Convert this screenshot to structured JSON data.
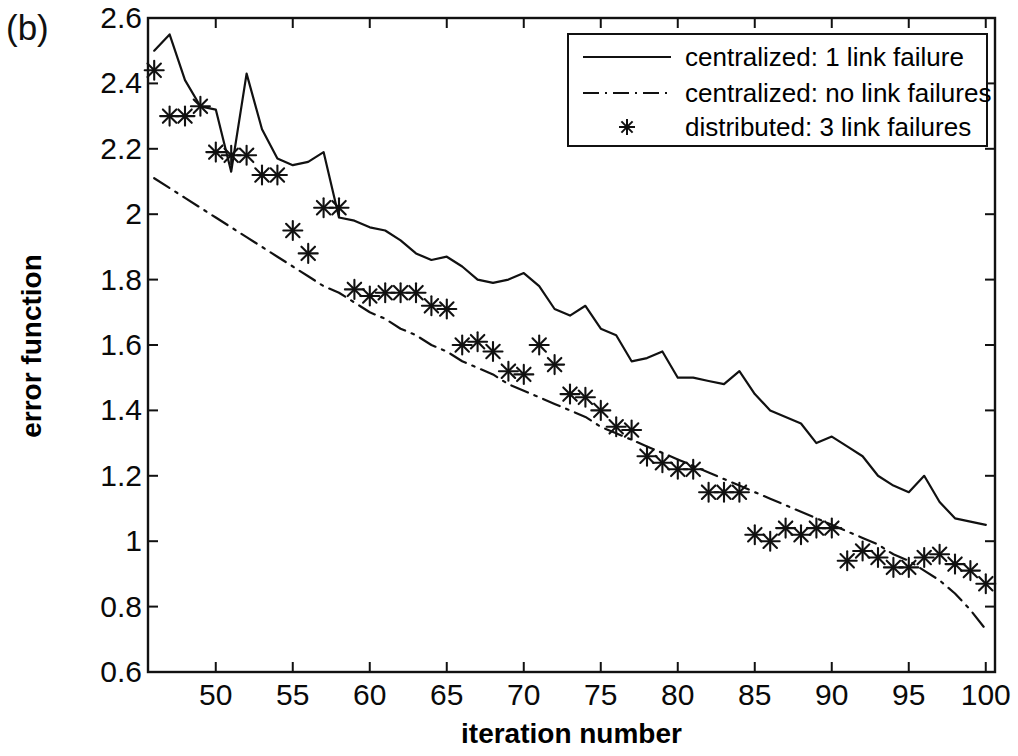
{
  "figure": {
    "panel_label": "(b)"
  },
  "chart_data": {
    "type": "line",
    "title": "",
    "xlabel": "iteration number",
    "ylabel": "error function",
    "xlim": [
      45.6,
      100.6
    ],
    "ylim": [
      0.6,
      2.6
    ],
    "xticks": [
      50,
      55,
      60,
      65,
      70,
      75,
      80,
      85,
      90,
      95,
      100
    ],
    "yticks": [
      "0.6",
      "0.8",
      "1",
      "1.2",
      "1.4",
      "1.6",
      "1.8",
      "2",
      "2.2",
      "2.4",
      "2.6"
    ],
    "grid": false,
    "legend_position": "top-right",
    "x": [
      46,
      47,
      48,
      49,
      50,
      51,
      52,
      53,
      54,
      55,
      56,
      57,
      58,
      59,
      60,
      61,
      62,
      63,
      64,
      65,
      66,
      67,
      68,
      69,
      70,
      71,
      72,
      73,
      74,
      75,
      76,
      77,
      78,
      79,
      80,
      81,
      82,
      83,
      84,
      85,
      86,
      87,
      88,
      89,
      90,
      91,
      92,
      93,
      94,
      95,
      96,
      97,
      98,
      99,
      100
    ],
    "series": [
      {
        "name": "centralized: 1 link failure",
        "style": "solid",
        "marker": "none",
        "color": "#111111",
        "values": [
          2.5,
          2.55,
          2.41,
          2.33,
          2.32,
          2.13,
          2.43,
          2.26,
          2.17,
          2.15,
          2.16,
          2.19,
          1.99,
          1.98,
          1.96,
          1.95,
          1.92,
          1.88,
          1.86,
          1.87,
          1.84,
          1.8,
          1.79,
          1.8,
          1.82,
          1.78,
          1.71,
          1.69,
          1.72,
          1.65,
          1.63,
          1.55,
          1.56,
          1.58,
          1.5,
          1.5,
          1.49,
          1.48,
          1.52,
          1.45,
          1.4,
          1.38,
          1.36,
          1.3,
          1.32,
          1.29,
          1.26,
          1.2,
          1.17,
          1.15,
          1.2,
          1.12,
          1.07,
          1.06,
          1.05
        ]
      },
      {
        "name": "centralized: no link failures",
        "style": "dashdot",
        "marker": "none",
        "color": "#111111",
        "values": [
          2.11,
          2.08,
          2.05,
          2.02,
          1.99,
          1.96,
          1.93,
          1.9,
          1.87,
          1.84,
          1.81,
          1.78,
          1.76,
          1.73,
          1.7,
          1.68,
          1.65,
          1.63,
          1.6,
          1.58,
          1.55,
          1.53,
          1.51,
          1.48,
          1.46,
          1.44,
          1.42,
          1.4,
          1.38,
          1.35,
          1.33,
          1.31,
          1.29,
          1.27,
          1.25,
          1.23,
          1.21,
          1.19,
          1.17,
          1.15,
          1.13,
          1.11,
          1.09,
          1.07,
          1.05,
          1.03,
          1.01,
          0.99,
          0.96,
          0.94,
          0.91,
          0.88,
          0.84,
          0.79,
          0.73
        ]
      },
      {
        "name": "distributed: 3 link failures",
        "style": "none",
        "marker": "asterisk",
        "color": "#111111",
        "values": [
          2.44,
          2.3,
          2.3,
          2.33,
          2.19,
          2.18,
          2.18,
          2.12,
          2.12,
          1.95,
          1.88,
          2.02,
          2.02,
          1.77,
          1.75,
          1.76,
          1.76,
          1.76,
          1.72,
          1.71,
          1.6,
          1.61,
          1.58,
          1.52,
          1.51,
          1.6,
          1.54,
          1.45,
          1.44,
          1.4,
          1.35,
          1.34,
          1.26,
          1.24,
          1.22,
          1.22,
          1.15,
          1.15,
          1.15,
          1.02,
          1.0,
          1.04,
          1.02,
          1.04,
          1.04,
          0.94,
          0.97,
          0.95,
          0.92,
          0.92,
          0.95,
          0.96,
          0.93,
          0.91,
          0.87
        ]
      }
    ]
  }
}
